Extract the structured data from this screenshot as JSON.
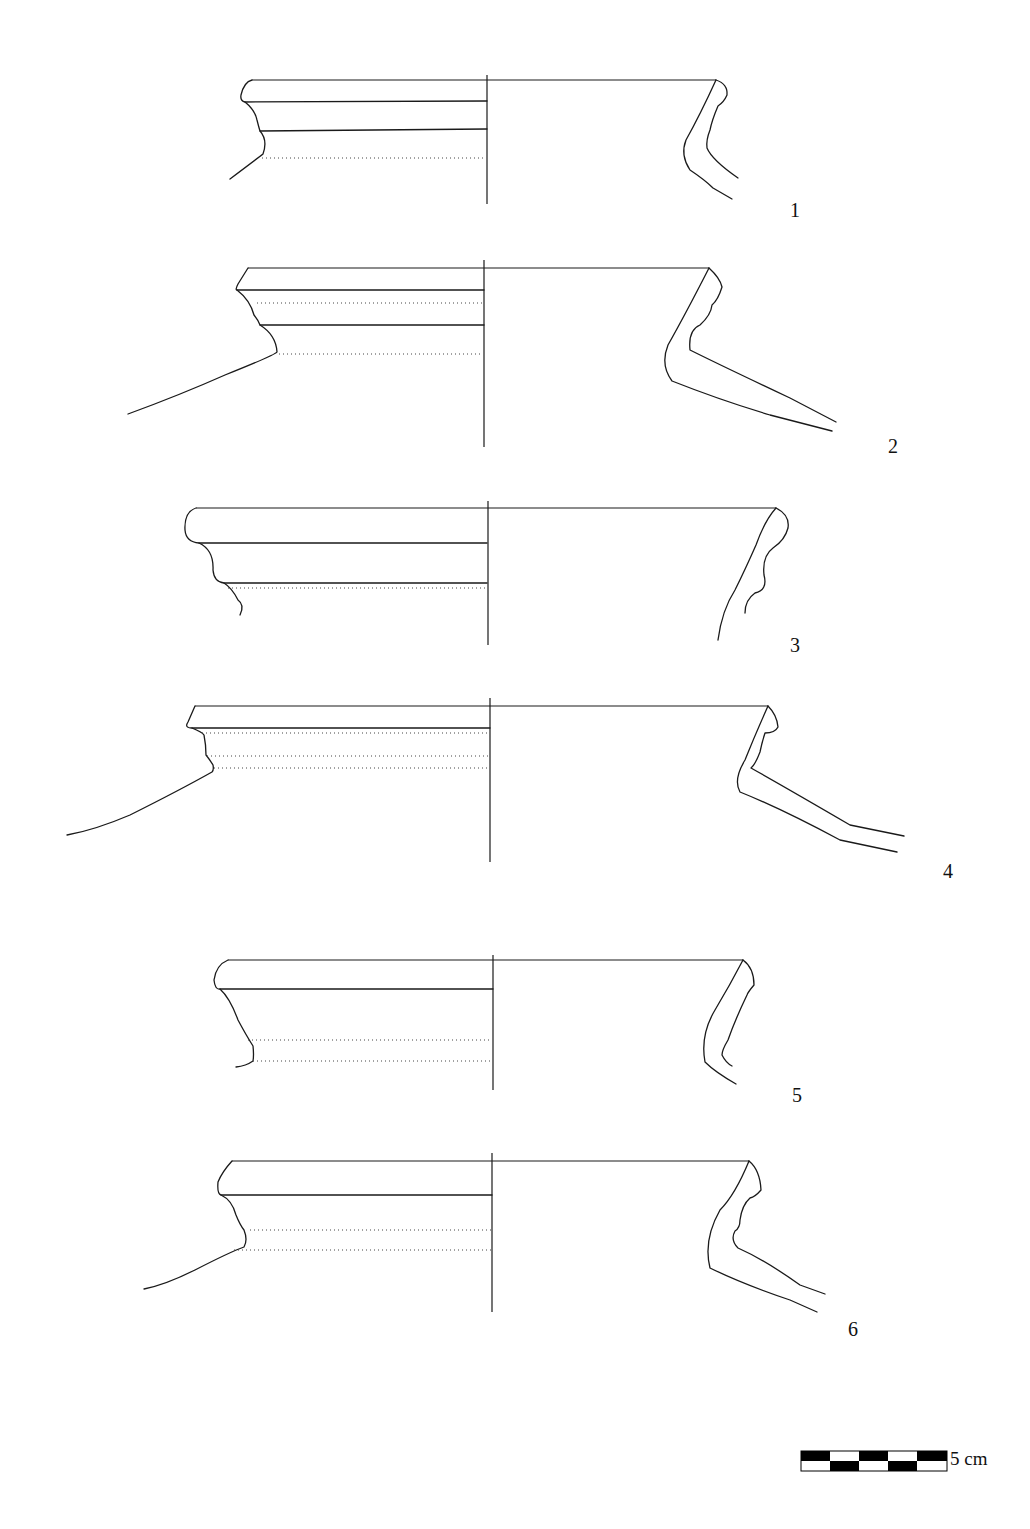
{
  "plate": {
    "type": "archaeological pottery rim profile drawings",
    "background": "#ffffff",
    "line_color": "#1a1a1a"
  },
  "figures": [
    {
      "number": "1",
      "label_pos": [
        790,
        200
      ]
    },
    {
      "number": "2",
      "label_pos": [
        888,
        437
      ]
    },
    {
      "number": "3",
      "label_pos": [
        790,
        636
      ]
    },
    {
      "number": "4",
      "label_pos": [
        943,
        862
      ]
    },
    {
      "number": "5",
      "label_pos": [
        792,
        1086
      ]
    },
    {
      "number": "6",
      "label_pos": [
        848,
        1320
      ]
    }
  ],
  "scale_bar": {
    "label": "5 cm",
    "segments": 5,
    "colors": [
      "#000000",
      "#ffffff"
    ]
  }
}
